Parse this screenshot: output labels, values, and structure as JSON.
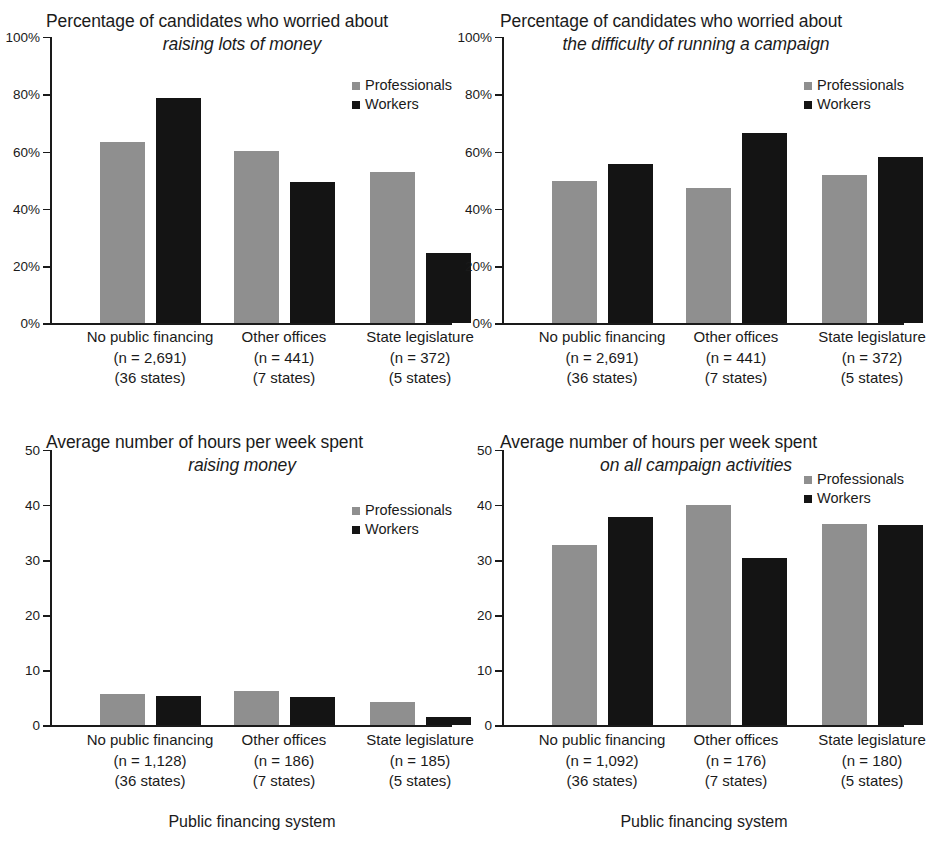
{
  "legend": {
    "professionals": "Professionals",
    "workers": "Workers"
  },
  "colors": {
    "professionals": "#8f8f8f",
    "workers": "#141414",
    "axis": "#1a1a1a",
    "background": "#ffffff"
  },
  "xaxis_title": "Public financing system",
  "categories": [
    "No public financing",
    "Other offices",
    "State legislature"
  ],
  "chart_data": [
    {
      "id": "top-left",
      "type": "bar",
      "title_line1": "Percentage of candidates who worried about",
      "title_line2": "raising lots of money",
      "title": "Percentage of candidates who worried about raising lots of money",
      "xlabel": "",
      "ylabel": "",
      "ylim": [
        0,
        100
      ],
      "yticks": [
        0,
        20,
        40,
        60,
        80,
        100
      ],
      "ytick_labels": [
        "0%",
        "20%",
        "40%",
        "60%",
        "80%",
        "100%"
      ],
      "grid": false,
      "legend_position": "upper right",
      "categories": [
        "No public financing",
        "Other offices",
        "State legislature"
      ],
      "category_notes": [
        {
          "n": "(n = 2,691)",
          "states": "(36 states)"
        },
        {
          "n": "(n = 441)",
          "states": "(7 states)"
        },
        {
          "n": "(n = 372)",
          "states": "(5 states)"
        }
      ],
      "series": [
        {
          "name": "Professionals",
          "values": [
            63.5,
            60.2,
            52.8
          ]
        },
        {
          "name": "Workers",
          "values": [
            78.8,
            49.5,
            24.5
          ]
        }
      ]
    },
    {
      "id": "top-right",
      "type": "bar",
      "title_line1": "Percentage of candidates who worried about",
      "title_line2": "the difficulty of running a campaign",
      "title": "Percentage of candidates who worried about the difficulty of running a campaign",
      "xlabel": "",
      "ylabel": "",
      "ylim": [
        0,
        100
      ],
      "yticks": [
        0,
        20,
        40,
        60,
        80,
        100
      ],
      "ytick_labels": [
        "0%",
        "20%",
        "40%",
        "60%",
        "80%",
        "100%"
      ],
      "grid": false,
      "legend_position": "upper right",
      "categories": [
        "No public financing",
        "Other offices",
        "State legislature"
      ],
      "category_notes": [
        {
          "n": "(n = 2,691)",
          "states": "(36 states)"
        },
        {
          "n": "(n = 441)",
          "states": "(7 states)"
        },
        {
          "n": "(n = 372)",
          "states": "(5 states)"
        }
      ],
      "series": [
        {
          "name": "Professionals",
          "values": [
            49.6,
            47.2,
            51.8
          ]
        },
        {
          "name": "Workers",
          "values": [
            55.6,
            66.4,
            58.2
          ]
        }
      ]
    },
    {
      "id": "bottom-left",
      "type": "bar",
      "title_line1": "Average number of hours per week spent",
      "title_line2": "raising money",
      "title": "Average number of hours per week spent raising money",
      "xlabel": "Public financing system",
      "ylabel": "",
      "ylim": [
        0,
        50
      ],
      "yticks": [
        0,
        10,
        20,
        30,
        40,
        50
      ],
      "ytick_labels": [
        "0",
        "10",
        "20",
        "30",
        "40",
        "50"
      ],
      "grid": false,
      "legend_position": "upper right",
      "categories": [
        "No public financing",
        "Other offices",
        "State legislature"
      ],
      "category_notes": [
        {
          "n": "(n = 1,128)",
          "states": "(36 states)"
        },
        {
          "n": "(n = 186)",
          "states": "(7 states)"
        },
        {
          "n": "(n = 185)",
          "states": "(5 states)"
        }
      ],
      "series": [
        {
          "name": "Professionals",
          "values": [
            5.7,
            6.2,
            4.3
          ]
        },
        {
          "name": "Workers",
          "values": [
            5.3,
            5.2,
            1.6
          ]
        }
      ]
    },
    {
      "id": "bottom-right",
      "type": "bar",
      "title_line1": "Average number of hours per week spent",
      "title_line2": "on all campaign activities",
      "title": "Average number of hours per week spent on all campaign activities",
      "xlabel": "Public financing system",
      "ylabel": "",
      "ylim": [
        0,
        50
      ],
      "yticks": [
        0,
        10,
        20,
        30,
        40,
        50
      ],
      "ytick_labels": [
        "0",
        "10",
        "20",
        "30",
        "40",
        "50"
      ],
      "grid": false,
      "legend_position": "upper right",
      "categories": [
        "No public financing",
        "Other offices",
        "State legislature"
      ],
      "category_notes": [
        {
          "n": "(n = 1,092)",
          "states": "(36 states)"
        },
        {
          "n": "(n = 176)",
          "states": "(7 states)"
        },
        {
          "n": "(n = 180)",
          "states": "(5 states)"
        }
      ],
      "series": [
        {
          "name": "Professionals",
          "values": [
            32.7,
            40.0,
            36.6
          ]
        },
        {
          "name": "Workers",
          "values": [
            37.8,
            30.4,
            36.4
          ]
        }
      ]
    }
  ]
}
